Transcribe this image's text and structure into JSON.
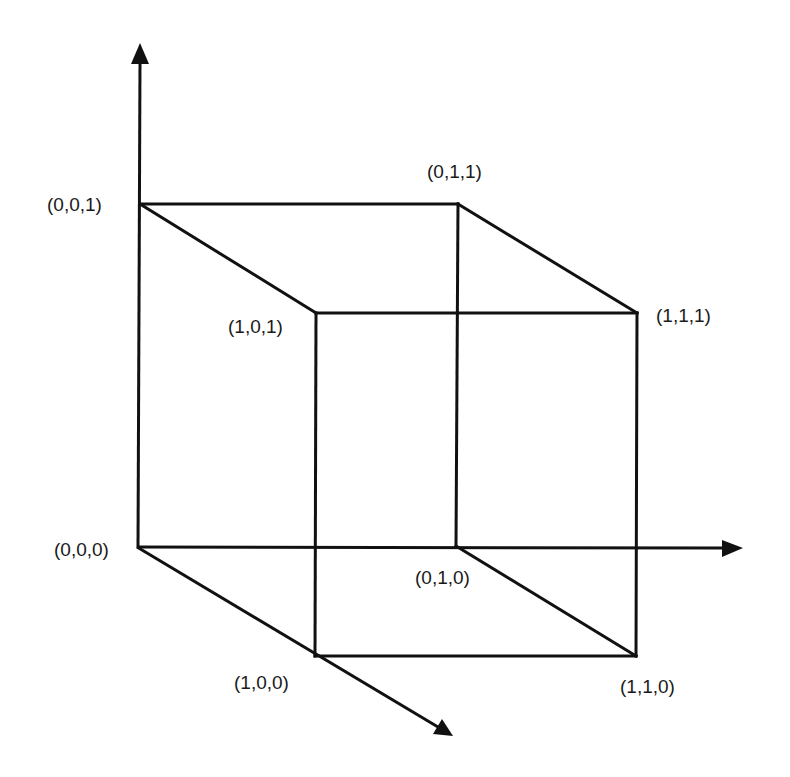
{
  "diagram": {
    "type": "unit-cube",
    "colors": {
      "line": "#111111",
      "text": "#1a1a1a",
      "background": "#ffffff"
    },
    "vertices": {
      "v000": {
        "label": "(0,0,0)",
        "x": 137,
        "y": 546
      },
      "v001": {
        "label": "(0,0,1)",
        "x": 140,
        "y": 204
      },
      "v010": {
        "label": "(0,1,0)",
        "x": 456,
        "y": 546
      },
      "v011": {
        "label": "(0,1,1)",
        "x": 458,
        "y": 204
      },
      "v100": {
        "label": "(1,0,0)",
        "x": 315,
        "y": 656
      },
      "v101": {
        "label": "(1,0,1)",
        "x": 316,
        "y": 313
      },
      "v110": {
        "label": "(1,1,0)",
        "x": 636,
        "y": 656
      },
      "v111": {
        "label": "(1,1,1)",
        "x": 637,
        "y": 313
      }
    },
    "axes": [
      {
        "name": "vertical-axis",
        "direction": "up"
      },
      {
        "name": "horizontal-axis",
        "direction": "right"
      },
      {
        "name": "diagonal-axis",
        "direction": "down-right"
      }
    ]
  }
}
